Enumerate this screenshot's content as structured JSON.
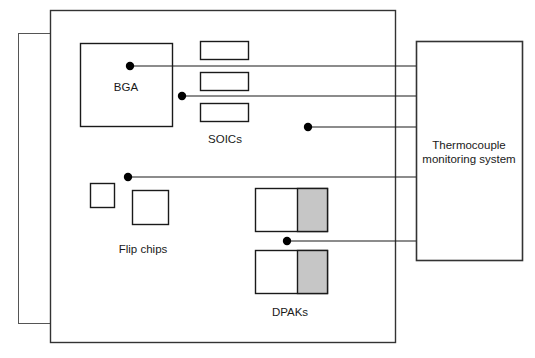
{
  "diagram": {
    "type": "schematic-diagram",
    "colors": {
      "line": "#1a1a1a",
      "thin_line": "#555555",
      "fill_white": "#ffffff",
      "fill_gray": "#c6c6c6",
      "dot": "#000000",
      "background": "#ffffff"
    }
  },
  "panels": {
    "back_board": {
      "name": "back-board",
      "x": 18,
      "y": 33,
      "w": 134,
      "h": 290
    },
    "main_board": {
      "name": "main-board",
      "x": 50,
      "y": 10,
      "w": 346,
      "h": 333
    }
  },
  "monitoring_system": {
    "label_line_1": "Thermocouple",
    "label_line_2": "monitoring system",
    "x": 416,
    "y": 41,
    "w": 106,
    "h": 219
  },
  "components": {
    "bga": {
      "label": "BGA",
      "x": 80,
      "y": 43,
      "w": 92,
      "h": 83,
      "label_x": 126,
      "label_y": 88
    },
    "soics": {
      "label": "SOICs",
      "label_x": 225,
      "label_y": 140,
      "rects": [
        {
          "x": 200,
          "y": 41,
          "w": 48,
          "h": 18
        },
        {
          "x": 200,
          "y": 72,
          "w": 48,
          "h": 18
        },
        {
          "x": 200,
          "y": 103,
          "w": 48,
          "h": 18
        }
      ]
    },
    "flip_chips": {
      "label": "Flip chips",
      "label_x": 143,
      "label_y": 250,
      "rects": [
        {
          "x": 90,
          "y": 183,
          "w": 24,
          "h": 24
        },
        {
          "x": 132,
          "y": 190,
          "w": 36,
          "h": 34
        }
      ]
    },
    "dpaks": {
      "label": "DPAKs",
      "label_x": 290,
      "label_y": 313,
      "rects": [
        {
          "x": 255,
          "y": 188,
          "w": 72,
          "h": 43,
          "gray_split_x": 297
        },
        {
          "x": 255,
          "y": 250,
          "w": 72,
          "h": 43,
          "gray_split_x": 297
        }
      ]
    }
  },
  "thermocouples": [
    {
      "id": "tc-bga",
      "target": "BGA",
      "dot_x": 130,
      "dot_y": 66,
      "bus_y": 66,
      "end_x": 416
    },
    {
      "id": "tc-soic",
      "target": "SOICs",
      "dot_x": 182,
      "dot_y": 96,
      "bus_y": 96,
      "end_x": 416
    },
    {
      "id": "tc-board",
      "target": "board",
      "dot_x": 308,
      "dot_y": 127,
      "bus_y": 127,
      "end_x": 416
    },
    {
      "id": "tc-flip",
      "target": "Flip chips",
      "dot_x": 128,
      "dot_y": 177,
      "bus_y": 177,
      "end_x": 416
    },
    {
      "id": "tc-dpak",
      "target": "DPAKs",
      "dot_x": 287,
      "dot_y": 241,
      "bus_y": 241,
      "end_x": 416
    }
  ],
  "dot_radius": 4.2
}
